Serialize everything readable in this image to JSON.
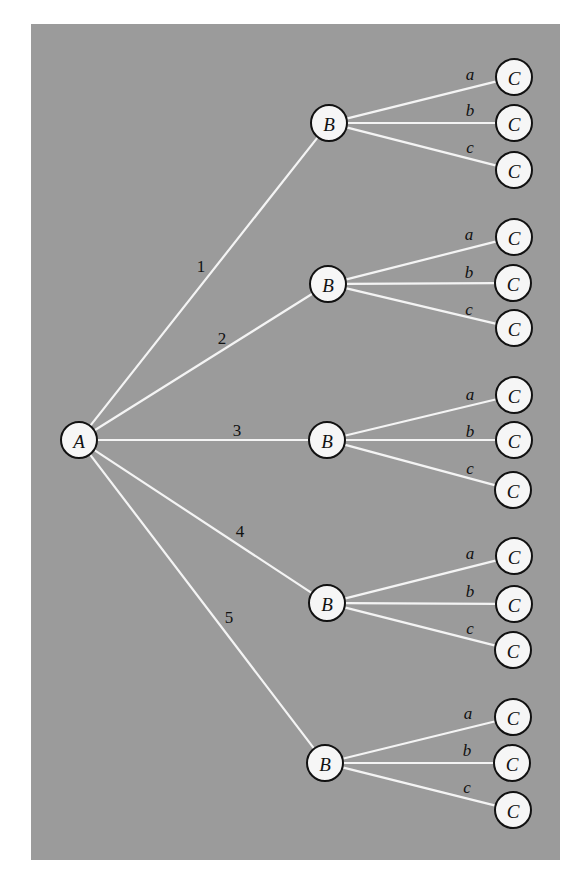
{
  "diagram": {
    "type": "tree",
    "background_color": "#9b9b9b",
    "edge_color": "#f4f4f4",
    "node_fill": "#f6f6f6",
    "node_stroke": "#111111",
    "panel": {
      "x": 31,
      "y": 24,
      "width": 529,
      "height": 836
    },
    "node_radius": 18,
    "root": {
      "label": "A",
      "x": 79,
      "y": 440
    },
    "branches": [
      {
        "edge_label": "1",
        "edge_label_pos": {
          "x": 201,
          "y": 266
        },
        "node": {
          "label": "B",
          "x": 329,
          "y": 123
        },
        "children": [
          {
            "edge_label": "a",
            "label_pos": {
              "x": 470,
              "y": 74
            },
            "node": {
              "label": "C",
              "x": 514,
              "y": 77
            }
          },
          {
            "edge_label": "b",
            "label_pos": {
              "x": 470,
              "y": 110
            },
            "node": {
              "label": "C",
              "x": 514,
              "y": 123
            }
          },
          {
            "edge_label": "c",
            "label_pos": {
              "x": 470,
              "y": 147
            },
            "node": {
              "label": "C",
              "x": 514,
              "y": 170
            }
          }
        ]
      },
      {
        "edge_label": "2",
        "edge_label_pos": {
          "x": 222,
          "y": 338
        },
        "node": {
          "label": "B",
          "x": 328,
          "y": 284
        },
        "children": [
          {
            "edge_label": "a",
            "label_pos": {
              "x": 469,
              "y": 234
            },
            "node": {
              "label": "C",
              "x": 514,
              "y": 237
            }
          },
          {
            "edge_label": "b",
            "label_pos": {
              "x": 469,
              "y": 272
            },
            "node": {
              "label": "C",
              "x": 513,
              "y": 283
            }
          },
          {
            "edge_label": "c",
            "label_pos": {
              "x": 469,
              "y": 309
            },
            "node": {
              "label": "C",
              "x": 514,
              "y": 328
            }
          }
        ]
      },
      {
        "edge_label": "3",
        "edge_label_pos": {
          "x": 237,
          "y": 430
        },
        "node": {
          "label": "B",
          "x": 327,
          "y": 440
        },
        "children": [
          {
            "edge_label": "a",
            "label_pos": {
              "x": 470,
              "y": 394
            },
            "node": {
              "label": "C",
              "x": 514,
              "y": 395
            }
          },
          {
            "edge_label": "b",
            "label_pos": {
              "x": 470,
              "y": 431
            },
            "node": {
              "label": "C",
              "x": 514,
              "y": 440
            }
          },
          {
            "edge_label": "c",
            "label_pos": {
              "x": 470,
              "y": 468
            },
            "node": {
              "label": "C",
              "x": 513,
              "y": 490
            }
          }
        ]
      },
      {
        "edge_label": "4",
        "edge_label_pos": {
          "x": 240,
          "y": 531
        },
        "node": {
          "label": "B",
          "x": 327,
          "y": 603
        },
        "children": [
          {
            "edge_label": "a",
            "label_pos": {
              "x": 470,
              "y": 553
            },
            "node": {
              "label": "C",
              "x": 514,
              "y": 556
            }
          },
          {
            "edge_label": "b",
            "label_pos": {
              "x": 470,
              "y": 591
            },
            "node": {
              "label": "C",
              "x": 514,
              "y": 604
            }
          },
          {
            "edge_label": "c",
            "label_pos": {
              "x": 470,
              "y": 628
            },
            "node": {
              "label": "C",
              "x": 513,
              "y": 650
            }
          }
        ]
      },
      {
        "edge_label": "5",
        "edge_label_pos": {
          "x": 229,
          "y": 617
        },
        "node": {
          "label": "B",
          "x": 325,
          "y": 763
        },
        "children": [
          {
            "edge_label": "a",
            "label_pos": {
              "x": 468,
              "y": 713
            },
            "node": {
              "label": "C",
              "x": 513,
              "y": 717
            }
          },
          {
            "edge_label": "b",
            "label_pos": {
              "x": 467,
              "y": 750
            },
            "node": {
              "label": "C",
              "x": 512,
              "y": 763
            }
          },
          {
            "edge_label": "c",
            "label_pos": {
              "x": 467,
              "y": 787
            },
            "node": {
              "label": "C",
              "x": 513,
              "y": 810
            }
          }
        ]
      }
    ]
  }
}
